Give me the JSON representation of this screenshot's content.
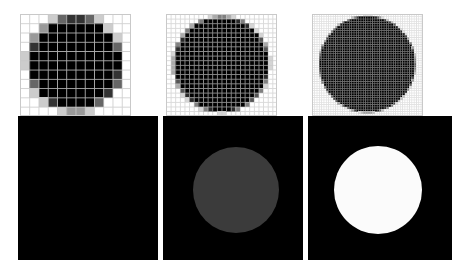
{
  "figure": {
    "width": 469,
    "height": 276,
    "background": "#ffffff",
    "layout": "2 rows x 3 columns"
  },
  "colors": {
    "page_background": "#ffffff",
    "grid_line": "#c8c8c8",
    "panel_border": "#c9c9c9",
    "cell_empty": "#ffffff",
    "cell_full": "#000000",
    "image_background": "#000000",
    "disk_black": "#000000",
    "disk_gray": "#3b3b3b",
    "disk_white": "#fbfbfb"
  },
  "panels": {
    "top": [
      {
        "id": "raster-coarse",
        "name": "top-left-rasterized-circle",
        "x": 20,
        "y": 14,
        "width": 111,
        "height": 102,
        "grid_cols": 12,
        "grid_rows": 11,
        "cell_px": 9.25,
        "show_grid": true,
        "circle": {
          "cx": 5.9,
          "cy": 5.3,
          "r": 5.1
        },
        "antialias": true,
        "label": ""
      },
      {
        "id": "raster-medium",
        "name": "top-middle-rasterized-circle",
        "x": 166,
        "y": 14,
        "width": 111,
        "height": 102,
        "grid_cols": 24,
        "grid_rows": 22,
        "cell_px": 4.625,
        "show_grid": true,
        "circle": {
          "cx": 11.9,
          "cy": 10.8,
          "r": 10.3
        },
        "antialias": true,
        "label": ""
      },
      {
        "id": "raster-fine",
        "name": "top-right-rasterized-circle",
        "x": 312,
        "y": 14,
        "width": 111,
        "height": 102,
        "grid_cols": 48,
        "grid_rows": 44,
        "cell_px": 2.3125,
        "show_grid": true,
        "circle": {
          "cx": 23.8,
          "cy": 21.6,
          "r": 20.8
        },
        "antialias": true,
        "label": ""
      }
    ],
    "bottom": [
      {
        "id": "image-black",
        "name": "bottom-left-black-image",
        "x": 18,
        "y": 116,
        "width": 140,
        "height": 144,
        "background": "#000000",
        "disk": null,
        "label": ""
      },
      {
        "id": "image-gray-disk",
        "name": "bottom-middle-gray-disk",
        "x": 163,
        "y": 116,
        "width": 140,
        "height": 144,
        "background": "#000000",
        "disk": {
          "cx": 73,
          "cy": 74,
          "r": 43,
          "color": "#3b3b3b"
        },
        "label": ""
      },
      {
        "id": "image-white-disk",
        "name": "bottom-right-white-disk",
        "x": 308,
        "y": 116,
        "width": 144,
        "height": 144,
        "background": "#000000",
        "disk": {
          "cx": 70,
          "cy": 74,
          "r": 44,
          "color": "#fbfbfb"
        },
        "label": ""
      }
    ]
  }
}
